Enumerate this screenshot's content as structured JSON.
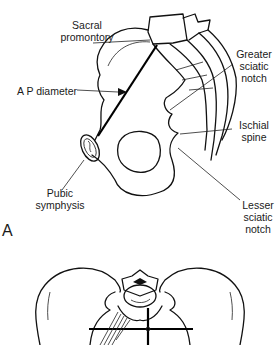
{
  "figure": {
    "panel_a": {
      "letter": "A",
      "labels": {
        "sacral_promontory": [
          "Sacral",
          "promontory"
        ],
        "ap_diameter": "A P diameter",
        "greater_sciatic_notch": [
          "Greater",
          "sciatic",
          "notch"
        ],
        "ischial_spine": [
          "Ischial",
          "spine"
        ],
        "pubic_symphysis": [
          "Pubic",
          "symphysis"
        ],
        "lesser_sciatic_notch": [
          "Lesser",
          "sciatic",
          "notch"
        ]
      }
    },
    "panel_b": {
      "description": "Superior view of pelvis with transverse and AP diameter lines"
    },
    "colors": {
      "ink": "#111111",
      "background": "#ffffff"
    }
  }
}
